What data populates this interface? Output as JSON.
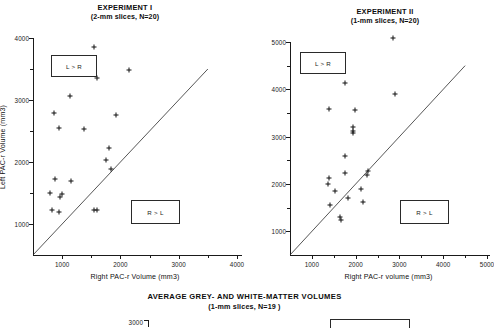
{
  "figure": {
    "background": "#ffffff",
    "ink_color": "#111111"
  },
  "panels": [
    {
      "id": "experiment-1",
      "title": "EXPERIMENT I",
      "subtitle": "(2-mm slices, N=20)",
      "legend_upper": "L > R",
      "legend_lower": "R > L"
    },
    {
      "id": "experiment-2",
      "title": "EXPERIMENT II",
      "subtitle": "(1-mm slices, N=20)",
      "legend_upper": "L > R",
      "legend_lower": "R > L"
    }
  ],
  "bottom": {
    "title": "AVERAGE GREY-  AND WHITE-MATTER VOLUMES",
    "subtitle": "(1-mm slices, N=19 )",
    "ytick": "3000"
  },
  "chart_data": [
    {
      "type": "scatter",
      "title": "EXPERIMENT I",
      "subtitle": "(2-mm slices, N=20)",
      "xlabel": "Right PAC-r Volume (mm3)",
      "ylabel": "Left PAC-r Volume (mm3)",
      "xlim": [
        500,
        4000
      ],
      "ylim": [
        500,
        4000
      ],
      "xticks": [
        1000,
        2000,
        3000,
        4000
      ],
      "yticks": [
        1000,
        2000,
        3000,
        4000
      ],
      "minor_ticks": true,
      "grid": false,
      "legend_position": "none",
      "annotations": [
        {
          "text": "L > R",
          "x": 1050,
          "y": 3400,
          "boxed": true
        },
        {
          "text": "R > L",
          "x": 2800,
          "y": 1050,
          "boxed": true
        }
      ],
      "reference_line": {
        "label": "identity y = x",
        "from": [
          500,
          500
        ],
        "to": [
          3500,
          3500
        ]
      },
      "marker": "plus",
      "points": [
        {
          "x": 1550,
          "y": 3850
        },
        {
          "x": 2150,
          "y": 3490
        },
        {
          "x": 1600,
          "y": 3350
        },
        {
          "x": 1140,
          "y": 3070
        },
        {
          "x": 860,
          "y": 2790
        },
        {
          "x": 1930,
          "y": 2760
        },
        {
          "x": 950,
          "y": 2550
        },
        {
          "x": 1380,
          "y": 2530
        },
        {
          "x": 1800,
          "y": 2220
        },
        {
          "x": 1750,
          "y": 2030
        },
        {
          "x": 1830,
          "y": 1880
        },
        {
          "x": 870,
          "y": 1720
        },
        {
          "x": 1150,
          "y": 1690
        },
        {
          "x": 790,
          "y": 1500
        },
        {
          "x": 1000,
          "y": 1480
        },
        {
          "x": 960,
          "y": 1440
        },
        {
          "x": 830,
          "y": 1230
        },
        {
          "x": 950,
          "y": 1200
        },
        {
          "x": 1540,
          "y": 1220
        },
        {
          "x": 1600,
          "y": 1230
        }
      ]
    },
    {
      "type": "scatter",
      "title": "EXPERIMENT II",
      "subtitle": "(1-mm slices, N=20)",
      "xlabel": "Right PAC-r volume (mm3)",
      "ylabel": "",
      "xlim": [
        500,
        5000
      ],
      "ylim": [
        500,
        5000
      ],
      "xticks": [
        1000,
        2000,
        3000,
        4000,
        5000
      ],
      "yticks": [
        1000,
        2000,
        3000,
        4000,
        5000
      ],
      "minor_ticks": true,
      "grid": false,
      "legend_position": "none",
      "annotations": [
        {
          "text": "L > R",
          "x": 1350,
          "y": 4500,
          "boxed": true
        },
        {
          "text": "R > L",
          "x": 3700,
          "y": 1300,
          "boxed": true
        }
      ],
      "reference_line": {
        "label": "identity y = x",
        "from": [
          500,
          500
        ],
        "to": [
          4500,
          4500
        ]
      },
      "marker": "plus",
      "points": [
        {
          "x": 2850,
          "y": 5080
        },
        {
          "x": 1760,
          "y": 4130
        },
        {
          "x": 2900,
          "y": 3900
        },
        {
          "x": 1400,
          "y": 3590
        },
        {
          "x": 1980,
          "y": 3570
        },
        {
          "x": 1950,
          "y": 3210
        },
        {
          "x": 1950,
          "y": 3120
        },
        {
          "x": 1950,
          "y": 3080
        },
        {
          "x": 1760,
          "y": 2600
        },
        {
          "x": 2280,
          "y": 2280
        },
        {
          "x": 2270,
          "y": 2200
        },
        {
          "x": 1750,
          "y": 2230
        },
        {
          "x": 1380,
          "y": 2120
        },
        {
          "x": 1370,
          "y": 2000
        },
        {
          "x": 2130,
          "y": 1900
        },
        {
          "x": 1530,
          "y": 1850
        },
        {
          "x": 1830,
          "y": 1700
        },
        {
          "x": 2160,
          "y": 1620
        },
        {
          "x": 1420,
          "y": 1560
        },
        {
          "x": 1640,
          "y": 1310
        },
        {
          "x": 1660,
          "y": 1250
        }
      ]
    }
  ]
}
